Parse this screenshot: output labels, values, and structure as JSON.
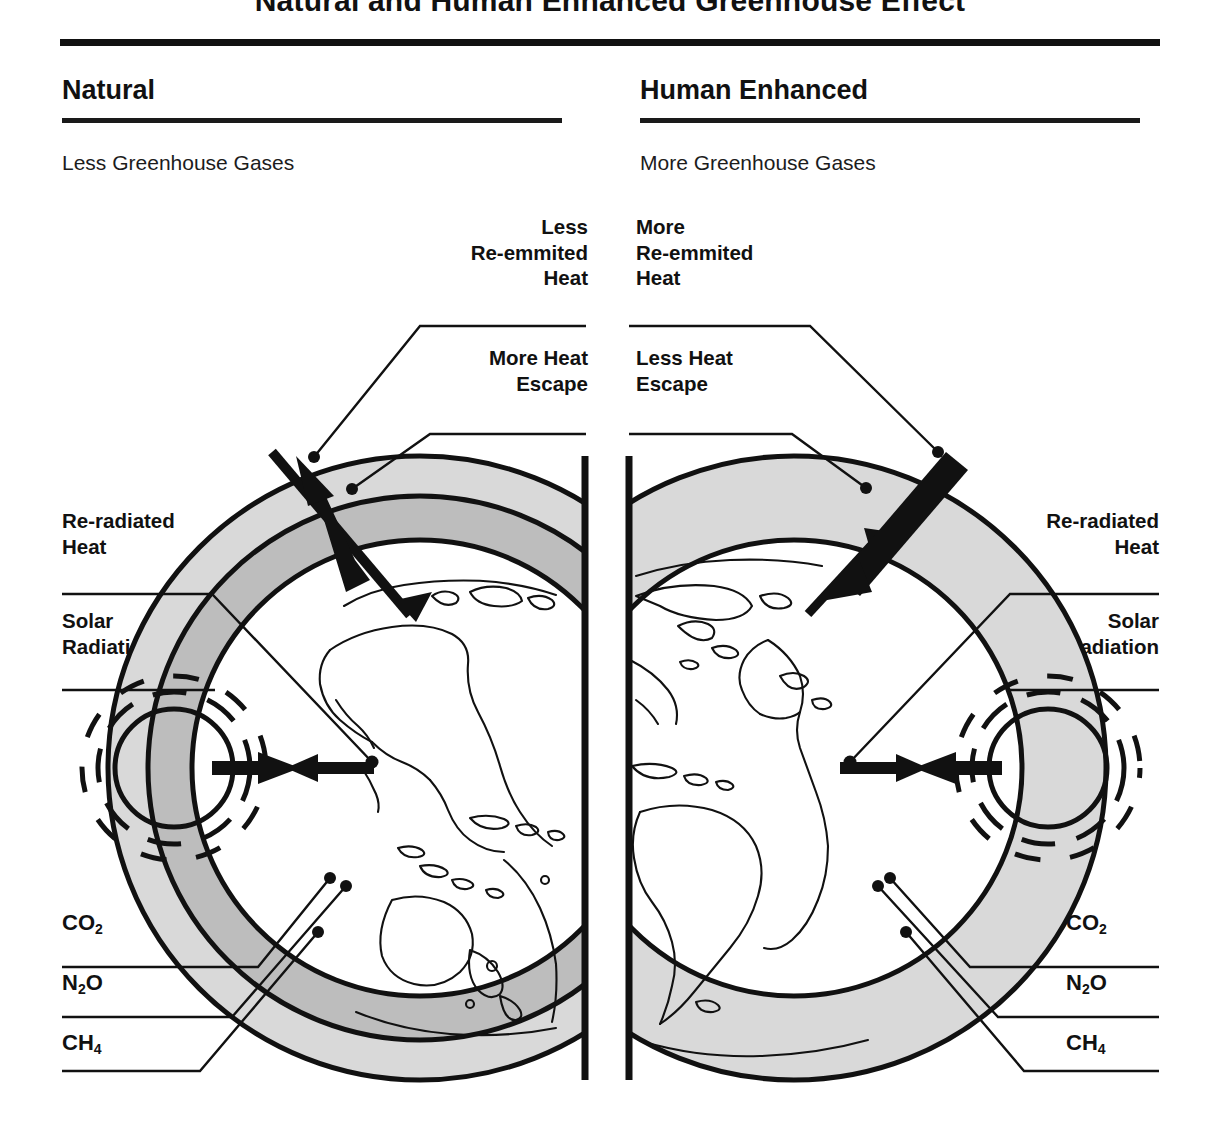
{
  "figure": {
    "title": "Natural and Human Enhanced Greenhouse Effect",
    "colors": {
      "ink": "#111111",
      "outer_atmosphere": "#d9d9d9",
      "inner_atmosphere": "#bdbdbd",
      "globe": "#ffffff",
      "background": "#ffffff"
    }
  },
  "columns": [
    {
      "id": "natural",
      "heading": "Natural",
      "subheading": "Less Greenhouse Gases",
      "labels": {
        "reemitted": "Less\nRe-emmited\nHeat",
        "escape": "More Heat\nEscape",
        "reradiated": "Re-radiated\nHeat",
        "solar": "Solar\nRadiation"
      },
      "gases": [
        "CO2",
        "N2O",
        "CH4"
      ]
    },
    {
      "id": "human-enhanced",
      "heading": "Human Enhanced",
      "subheading": "More Greenhouse Gases",
      "labels": {
        "reemitted": "More\nRe-emmited\nHeat",
        "escape": "Less Heat\nEscape",
        "reradiated": "Re-radiated\nHeat",
        "solar": "Solar\nRadiation"
      },
      "gases": [
        "CO2",
        "N2O",
        "CH4"
      ]
    }
  ],
  "gas_formulas": {
    "co2": {
      "main": "CO",
      "sub": "2"
    },
    "n2o_a": {
      "main": "N",
      "sub": "2"
    },
    "n2o_b": {
      "main": "O"
    },
    "ch4": {
      "main": "CH",
      "sub": "4"
    }
  }
}
